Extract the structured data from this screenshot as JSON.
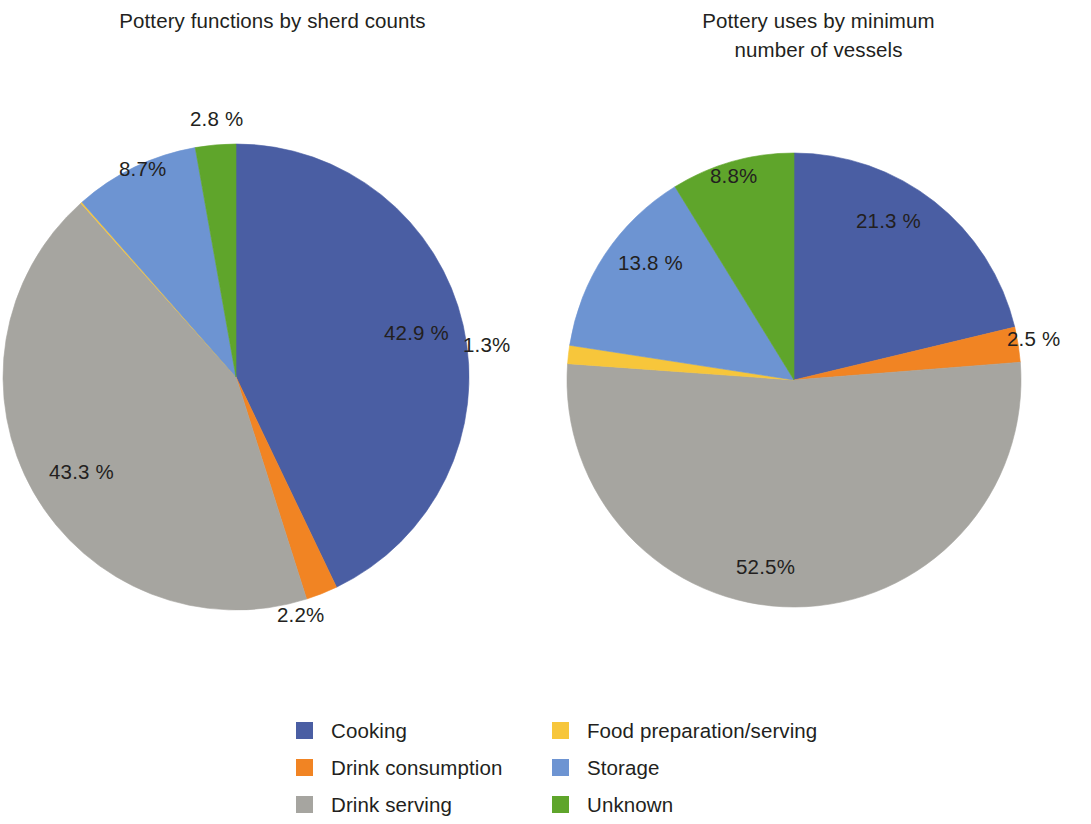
{
  "chart_data": [
    {
      "type": "pie",
      "id": "sherd-counts",
      "title": "Pottery functions by sherd counts",
      "labels": [
        "Cooking",
        "Drink consumption",
        "Drink serving",
        "Food preparation/serving",
        "Storage",
        "Unknown"
      ],
      "values": [
        42.9,
        2.2,
        43.3,
        0.1,
        8.7,
        2.8
      ],
      "value_labels": [
        "42.9 %",
        "2.2%",
        "43.3 %",
        "",
        "8.7%",
        "2.8 %"
      ],
      "colors": [
        "#4a5ea3",
        "#f18423",
        "#a6a5a0",
        "#f6c githubusercontent",
        "#6d94d2",
        "#5fa52b"
      ],
      "legend_position": "bottom",
      "grid": false,
      "start_angle_deg": 0,
      "direction": "clockwise"
    },
    {
      "type": "pie",
      "id": "minimum-number-of-vessels",
      "title": "Pottery uses by minimum number of vessels",
      "labels": [
        "Cooking",
        "Drink consumption",
        "Drink serving",
        "Food preparation/serving",
        "Storage",
        "Unknown"
      ],
      "values": [
        21.3,
        2.5,
        52.5,
        1.3,
        13.8,
        8.8
      ],
      "value_labels": [
        "21.3 %",
        "2.5 %",
        "52.5%",
        "1.3%",
        "13.8 %",
        "8.8%"
      ],
      "colors": [
        "#4a5ea3",
        "#f18423",
        "#a6a5a0",
        "#f7c63b",
        "#6d94d2",
        "#5fa52b"
      ],
      "legend_position": "bottom",
      "grid": false,
      "start_angle_deg": 0,
      "direction": "clockwise"
    }
  ],
  "titles": {
    "left": "Pottery functions by sherd counts",
    "right_line1": "Pottery uses by minimum",
    "right_line2": "number of vessels"
  },
  "left_chart": {
    "slices": [
      {
        "key": "cooking",
        "label": "42.9 %",
        "color": "#4a5ea3",
        "pct": 42.9
      },
      {
        "key": "drink_cons",
        "label": "2.2%",
        "color": "#f18423",
        "pct": 2.2
      },
      {
        "key": "drink_serv",
        "label": "43.3 %",
        "color": "#a6a5a0",
        "pct": 43.3
      },
      {
        "key": "food_prep",
        "label": "",
        "color": "#f7c63b",
        "pct": 0.1
      },
      {
        "key": "storage",
        "label": "8.7%",
        "color": "#6d94d2",
        "pct": 8.7
      },
      {
        "key": "unknown",
        "label": "2.8 %",
        "color": "#5fa52b",
        "pct": 2.8
      }
    ]
  },
  "right_chart": {
    "slices": [
      {
        "key": "cooking",
        "label": "21.3 %",
        "color": "#4a5ea3",
        "pct": 21.3
      },
      {
        "key": "drink_cons",
        "label": "2.5 %",
        "color": "#f18423",
        "pct": 2.5
      },
      {
        "key": "drink_serv",
        "label": "52.5%",
        "color": "#a6a5a0",
        "pct": 52.5
      },
      {
        "key": "food_prep",
        "label": "1.3%",
        "color": "#f7c63b",
        "pct": 1.3
      },
      {
        "key": "storage",
        "label": "13.8 %",
        "color": "#6d94d2",
        "pct": 13.8
      },
      {
        "key": "unknown",
        "label": "8.8%",
        "color": "#5fa52b",
        "pct": 8.8
      }
    ]
  },
  "legend": {
    "column1": [
      {
        "label": "Cooking",
        "color": "#4a5ea3"
      },
      {
        "label": "Drink consumption",
        "color": "#f18423"
      },
      {
        "label": "Drink serving",
        "color": "#a6a5a0"
      }
    ],
    "column2": [
      {
        "label": "Food preparation/serving",
        "color": "#f7c63b"
      },
      {
        "label": "Storage",
        "color": "#6d94d2"
      },
      {
        "label": "Unknown",
        "color": "#5fa52b"
      }
    ]
  }
}
